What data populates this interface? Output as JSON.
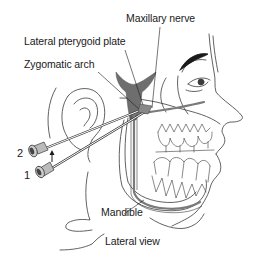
{
  "diagram": {
    "labels": {
      "maxillary_nerve": "Maxillary nerve",
      "lateral_pterygoid_plate": "Lateral pterygoid plate",
      "zygomatic_arch": "Zygomatic arch",
      "mandible": "Mandible",
      "view_caption": "Lateral view"
    },
    "needle_positions": {
      "first": "1",
      "second": "2"
    },
    "colors": {
      "line": "#3a3a3a",
      "nerve_fill": "#6e6e6e",
      "bone_fill": "#7a7a7a",
      "background": "#ffffff",
      "text": "#1a1a1a"
    }
  }
}
